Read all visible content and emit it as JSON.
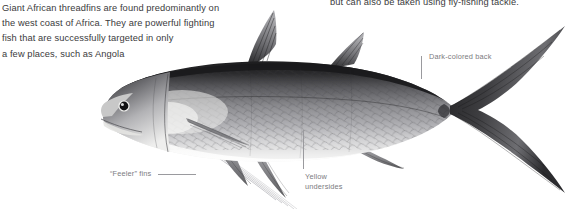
{
  "page": {
    "background_color": "#ffffff",
    "body_text_color": "#3a3a3c",
    "callout_text_color": "#7b7b80",
    "leader_line_color": "#9a9a9e"
  },
  "intro_text": {
    "line1": "Giant African threadfins are found predominantly on",
    "line2": "the west coast of Africa. They are powerful fighting",
    "line3": "fish that are successfully targeted in only",
    "line4": "a few places, such as Angola"
  },
  "top_right_text": {
    "line1": "but can also be taken using fly-fishing tackle."
  },
  "callouts": [
    {
      "id": "dark-back",
      "label": "Dark-colored back",
      "label_line1": "Dark-colored back",
      "label_line2": ""
    },
    {
      "id": "feeler-fins",
      "label": "“Feeler” fins",
      "label_line1": "“Feeler” fins",
      "label_line2": ""
    },
    {
      "id": "yellow-undersides",
      "label": "Yellow undersides",
      "label_line1": "Yellow",
      "label_line2": "undersides"
    }
  ],
  "illustration": {
    "subject": "Giant African threadfin (Polydactylus quadrifilis)",
    "style": "grayscale scientific illustration",
    "orientation": "facing left",
    "features": [
      "dark-colored back",
      "pale yellow undersides",
      "deeply forked caudal fin",
      "two dorsal fins",
      "threadfin filament feelers below pectoral fin",
      "large dark eye",
      "scaled flank"
    ],
    "tones": {
      "back": "#2e2e30",
      "flank": "#8a8a8d",
      "belly": "#efefee",
      "fin": "#56565a",
      "filament": "#c9c9cc"
    }
  }
}
